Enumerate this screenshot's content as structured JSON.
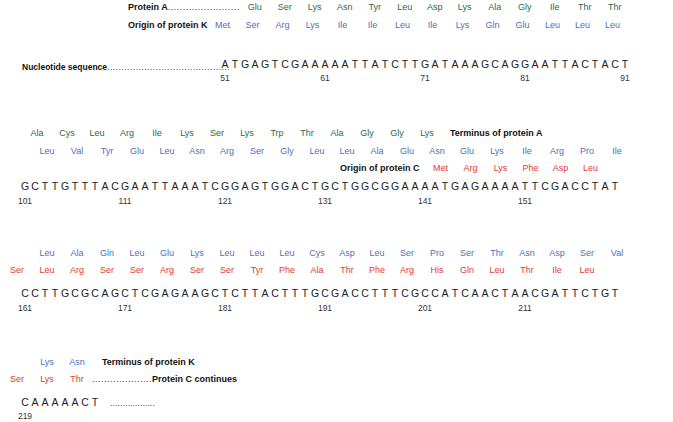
{
  "figure": {
    "title": "",
    "labels": {
      "protein_a": "Protein A",
      "origin_protein_k": "Origin of protein K",
      "nucleotide_sequence": "Nucleotide sequence",
      "terminus_protein_a": "Terminus of protein A",
      "origin_protein_c": "Origin of protein C",
      "terminus_protein_k": "Terminus of protein K",
      "protein_c_continues": "Protein C continues",
      "leader_dots_short": "....................",
      "leader_dots_long": "........................"
    },
    "colors": {
      "frame_green": "#1f6b4a",
      "frame_blue": "#4a6fc4",
      "frame_red": "#e03a30",
      "nucleotide": "#222222",
      "label": "#111111",
      "background": "#ffffff"
    },
    "blocks": [
      {
        "id": "block-1",
        "rows": [
          {
            "frame": "green",
            "label": "Protein A",
            "label_leader": "........................",
            "residues": [
              "Glu",
              "Ser",
              "Lys",
              "Asn",
              "Tyr",
              "Leu",
              "Asp",
              "Lys",
              "Ala",
              "Gly",
              "Ile",
              "Thr",
              "Thr"
            ]
          },
          {
            "frame": "blue",
            "label": "Origin of protein K",
            "label_leader": "",
            "residues": [
              "Met",
              "Ser",
              "Arg",
              "Lys",
              "Ile",
              "Ile",
              "Leu",
              "Ile",
              "Lys",
              "Gln",
              "Glu",
              "Leu",
              "Leu",
              "Leu"
            ]
          }
        ],
        "sequence_label": "Nucleotide sequence",
        "sequence_leader": "...........................................",
        "sequence": "ATGAGTCGAAAAATTATCTTGATAAAGCAGGAATTACTACT",
        "positions": [
          51,
          61,
          71,
          81,
          91
        ]
      },
      {
        "id": "block-2",
        "rows": [
          {
            "frame": "green",
            "label": "Terminus of protein A",
            "residues": [
              "Ala",
              "Cys",
              "Leu",
              "Arg",
              "Ile",
              "Lys",
              "Ser",
              "Lys",
              "Trp",
              "Thr",
              "Ala",
              "Gly",
              "Gly",
              "Lys"
            ]
          },
          {
            "frame": "blue",
            "label": "Origin of protein C",
            "residues": [
              "Leu",
              "Val",
              "Tyr",
              "Glu",
              "Leu",
              "Asn",
              "Arg",
              "Ser",
              "Gly",
              "Leu",
              "Leu",
              "Ala",
              "Glu",
              "Asn",
              "Glu",
              "Lys",
              "Ile",
              "Arg",
              "Pro",
              "Ile"
            ]
          },
          {
            "frame": "red",
            "label": "Origin of protein C",
            "residues": [
              "Met",
              "Arg",
              "Lys",
              "Phe",
              "Asp",
              "Leu"
            ]
          }
        ],
        "sequence": "GCTTGTTTACGAATTAAATCGGAGTGGACTGCTGGCGGAAAATGAGAAAATTCGACCTAT",
        "positions": [
          101,
          111,
          121,
          131,
          141,
          151
        ]
      },
      {
        "id": "block-3",
        "rows": [
          {
            "frame": "blue",
            "residues": [
              "Leu",
              "Ala",
              "Gln",
              "Leu",
              "Glu",
              "Lys",
              "Leu",
              "Leu",
              "Leu",
              "Cys",
              "Asp",
              "Leu",
              "Ser",
              "Pro",
              "Ser",
              "Thr",
              "Asn",
              "Asp",
              "Ser",
              "Val"
            ]
          },
          {
            "frame": "red",
            "residues": [
              "Ser",
              "Leu",
              "Arg",
              "Ser",
              "Ser",
              "Arg",
              "Ser",
              "Ser",
              "Tyr",
              "Phe",
              "Ala",
              "Thr",
              "Phe",
              "Arg",
              "His",
              "Gln",
              "Leu",
              "Thr",
              "Ile",
              "Leu"
            ]
          }
        ],
        "sequence": "CCTTGCGCAGCTCGAGAAGCTCTTACTTTGCGACCTTTCGCCATCAACTAACGATTCTGT",
        "positions": [
          161,
          171,
          181,
          191,
          201,
          211
        ]
      },
      {
        "id": "block-4",
        "rows": [
          {
            "frame": "blue",
            "label": "Terminus of protein K",
            "residues": [
              "Lys",
              "Asn"
            ]
          },
          {
            "frame": "red",
            "label": "Protein C continues",
            "residues": [
              "Ser",
              "Lys",
              "Thr"
            ]
          }
        ],
        "sequence": "CAAAAACT",
        "sequence_trailer": "..................",
        "positions": [
          219
        ]
      }
    ]
  }
}
